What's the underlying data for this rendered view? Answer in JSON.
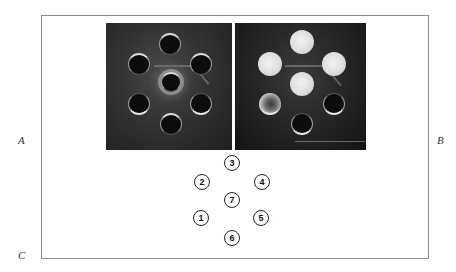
{
  "figure": {
    "panel_labels": {
      "a": "A",
      "b": "B",
      "c": "C"
    },
    "panels": [
      {
        "id": "A",
        "description": "photograph of seven-well plate, all wells dark",
        "wells": [
          {
            "number": "3",
            "state": "dark"
          },
          {
            "number": "2",
            "state": "dark"
          },
          {
            "number": "4",
            "state": "dark"
          },
          {
            "number": "7",
            "state": "dark-halo"
          },
          {
            "number": "1",
            "state": "dark"
          },
          {
            "number": "5",
            "state": "dark"
          },
          {
            "number": "6",
            "state": "dark"
          }
        ]
      },
      {
        "id": "B",
        "description": "photograph of seven-well plate, several wells bright",
        "wells": [
          {
            "number": "3",
            "state": "bright"
          },
          {
            "number": "2",
            "state": "bright"
          },
          {
            "number": "4",
            "state": "bright"
          },
          {
            "number": "7",
            "state": "bright"
          },
          {
            "number": "1",
            "state": "partial"
          },
          {
            "number": "5",
            "state": "dark"
          },
          {
            "number": "6",
            "state": "dark"
          }
        ]
      }
    ],
    "key": {
      "id": "C",
      "wells": [
        "3",
        "2",
        "4",
        "7",
        "1",
        "5",
        "6"
      ]
    }
  }
}
